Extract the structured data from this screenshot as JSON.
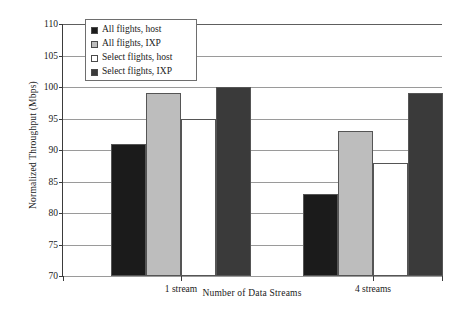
{
  "chart_data": {
    "type": "bar",
    "title": "",
    "xlabel": "Number of Data Streams",
    "ylabel": "Normalized Throughput (Mbps)",
    "categories": [
      "1 stream",
      "4 streams"
    ],
    "ylim": [
      70,
      110
    ],
    "ytick_step": 5,
    "yticks": [
      "110",
      "105",
      "100",
      "95",
      "90",
      "85",
      "80",
      "75",
      "70"
    ],
    "grid": true,
    "legend_position": "upper-left-inside",
    "series": [
      {
        "name": "All flights, host",
        "color": "#1b1b1b",
        "values": [
          91,
          83
        ]
      },
      {
        "name": "All flights, IXP",
        "color": "#bdbdbd",
        "values": [
          99,
          93
        ]
      },
      {
        "name": "Select flights, host",
        "color": "#ffffff",
        "values": [
          95,
          88
        ]
      },
      {
        "name": "Select flights, IXP",
        "color": "#3a3a3a",
        "values": [
          100,
          99
        ]
      }
    ]
  },
  "legend": {
    "items": [
      {
        "label": "All flights, host"
      },
      {
        "label": "All flights, IXP"
      },
      {
        "label": "Select flights, host"
      },
      {
        "label": "Select flights, IXP"
      }
    ]
  },
  "axes": {
    "y_title": "Normalized Throughput (Mbps)",
    "x_title": "Number of Data Streams",
    "y_ticks": [
      "110",
      "105",
      "100",
      "95",
      "90",
      "85",
      "80",
      "75",
      "70"
    ],
    "x_ticks": [
      "1 stream",
      "4 streams"
    ]
  }
}
